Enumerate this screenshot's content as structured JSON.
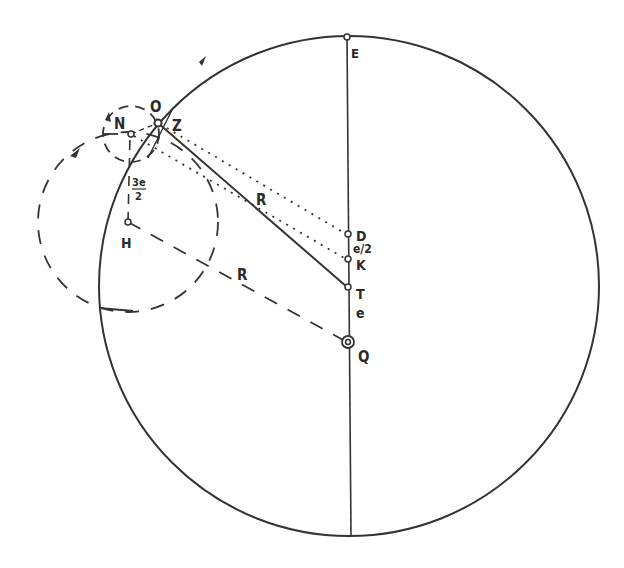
{
  "diagram": {
    "stroke_color": "#333333",
    "labels": {
      "E": "E",
      "O": "O",
      "Z": "Z",
      "N": "N",
      "H": "H",
      "D": "D",
      "K": "K",
      "T": "T",
      "Q": "Q",
      "R_solid": "R",
      "R_dashed": "R",
      "e_half": "e/2",
      "e": "e",
      "three_e_num": "3e",
      "three_e_den": "2"
    }
  }
}
